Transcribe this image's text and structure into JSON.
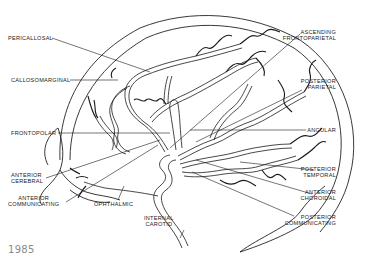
{
  "figure": {
    "type": "anatomical-line-drawing"
  },
  "labels": {
    "left": [
      {
        "id": "pericallosal",
        "lines": [
          "PERICALLOSAL"
        ]
      },
      {
        "id": "callosomarginal",
        "lines": [
          "CALLOSOMARGINAL"
        ]
      },
      {
        "id": "frontopolar",
        "lines": [
          "FRONTOPOLAR"
        ]
      },
      {
        "id": "anterior-cerebral",
        "lines": [
          "ANTERIOR",
          "CEREBRAL"
        ]
      },
      {
        "id": "anterior-communicating",
        "lines": [
          "ANTERIOR",
          "COMMUNICATING"
        ]
      }
    ],
    "bottom": [
      {
        "id": "ophthalmic",
        "lines": [
          "OPHTHALMIC"
        ]
      },
      {
        "id": "internal-carotid",
        "lines": [
          "INTERNAL",
          "CAROTID"
        ]
      }
    ],
    "right": [
      {
        "id": "ascending-frontoparietal",
        "lines": [
          "ASCENDING",
          "FRONTOPARIETAL"
        ]
      },
      {
        "id": "posterior-parietal",
        "lines": [
          "POSTERIOR",
          "PARIETAL"
        ]
      },
      {
        "id": "angular",
        "lines": [
          "ANGULAR"
        ]
      },
      {
        "id": "posterior-temporal",
        "lines": [
          "POSTERIOR",
          "TEMPORAL"
        ]
      },
      {
        "id": "anterior-choroidal",
        "lines": [
          "ANTERIOR",
          "CHOROIDAL"
        ]
      },
      {
        "id": "posterior-communicating",
        "lines": [
          "POSTERIOR",
          "COMMUNICATING"
        ]
      }
    ]
  },
  "caption": {
    "year": "1985"
  },
  "colors": {
    "line": "#1a1a1a",
    "background": "#ffffff",
    "year_text": "#8a8a8a"
  }
}
